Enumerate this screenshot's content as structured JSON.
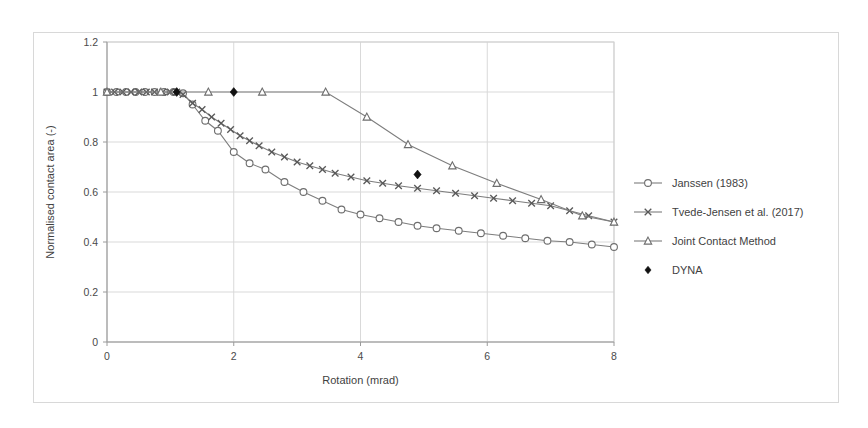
{
  "figure": {
    "background_color": "#ffffff",
    "frame_color": "#d8d8d8"
  },
  "chart_data": {
    "type": "line",
    "title": "",
    "xlabel": "Rotation (mrad)",
    "ylabel": "Normalised contact area (-)",
    "xlim": [
      0,
      8
    ],
    "ylim": [
      0,
      1.2
    ],
    "xticks": [
      0,
      2,
      4,
      6,
      8
    ],
    "xtick_labels": [
      "0",
      "2",
      "4",
      "6",
      "8"
    ],
    "yticks": [
      0,
      0.2,
      0.4,
      0.6,
      0.8,
      1,
      1.2
    ],
    "ytick_labels": [
      "0",
      "0.2",
      "0.4",
      "0.6",
      "0.8",
      "1",
      "1.2"
    ],
    "grid": true,
    "legend_position": "right",
    "series": [
      {
        "name": "Janssen (1983)",
        "marker": "circle-open",
        "color": "#6e6e6e",
        "x": [
          0.0,
          0.15,
          0.3,
          0.45,
          0.6,
          0.75,
          0.9,
          1.05,
          1.2,
          1.35,
          1.55,
          1.75,
          2.0,
          2.25,
          2.5,
          2.8,
          3.1,
          3.4,
          3.7,
          4.0,
          4.3,
          4.6,
          4.9,
          5.2,
          5.55,
          5.9,
          6.25,
          6.6,
          6.95,
          7.3,
          7.65,
          8.0
        ],
        "y": [
          1.0,
          1.0,
          1.0,
          1.0,
          1.0,
          1.0,
          1.0,
          1.0,
          0.995,
          0.95,
          0.885,
          0.845,
          0.76,
          0.715,
          0.69,
          0.64,
          0.6,
          0.565,
          0.53,
          0.51,
          0.495,
          0.48,
          0.465,
          0.455,
          0.445,
          0.435,
          0.425,
          0.415,
          0.405,
          0.4,
          0.39,
          0.38
        ]
      },
      {
        "name": "Tvede-Jensen et al. (2017)",
        "marker": "x",
        "color": "#585858",
        "x": [
          0.0,
          0.12,
          0.25,
          0.38,
          0.5,
          0.62,
          0.75,
          0.88,
          1.0,
          1.1,
          1.2,
          1.35,
          1.5,
          1.65,
          1.8,
          1.95,
          2.1,
          2.25,
          2.4,
          2.6,
          2.8,
          3.0,
          3.2,
          3.4,
          3.6,
          3.85,
          4.1,
          4.35,
          4.6,
          4.9,
          5.2,
          5.5,
          5.8,
          6.1,
          6.4,
          6.7,
          7.0,
          7.3,
          7.6,
          8.0
        ],
        "y": [
          1.0,
          1.0,
          1.0,
          1.0,
          1.0,
          1.0,
          1.0,
          1.0,
          1.0,
          1.0,
          0.99,
          0.955,
          0.93,
          0.9,
          0.875,
          0.85,
          0.825,
          0.805,
          0.785,
          0.76,
          0.74,
          0.72,
          0.705,
          0.69,
          0.675,
          0.66,
          0.645,
          0.635,
          0.625,
          0.615,
          0.605,
          0.595,
          0.585,
          0.575,
          0.565,
          0.555,
          0.545,
          0.525,
          0.505,
          0.48
        ]
      },
      {
        "name": "Joint Contact Method",
        "marker": "triangle-open",
        "color": "#7d7d7d",
        "x": [
          0.0,
          0.85,
          1.6,
          2.45,
          3.45,
          4.1,
          4.75,
          5.45,
          6.15,
          6.85,
          7.5,
          8.0
        ],
        "y": [
          1.0,
          1.0,
          1.0,
          1.0,
          1.0,
          0.9,
          0.79,
          0.705,
          0.635,
          0.57,
          0.505,
          0.48
        ]
      },
      {
        "name": "DYNA",
        "marker": "diamond-solid",
        "color": "#111111",
        "x": [
          1.1,
          2.0,
          4.9
        ],
        "y": [
          1.0,
          1.0,
          0.67
        ]
      }
    ]
  },
  "legend": {
    "entries": [
      {
        "label": "Janssen (1983)",
        "marker": "circle-open"
      },
      {
        "label": "Tvede-Jensen et al. (2017)",
        "marker": "x"
      },
      {
        "label": "Joint Contact Method",
        "marker": "triangle-open"
      },
      {
        "label": "DYNA",
        "marker": "diamond-solid"
      }
    ]
  }
}
